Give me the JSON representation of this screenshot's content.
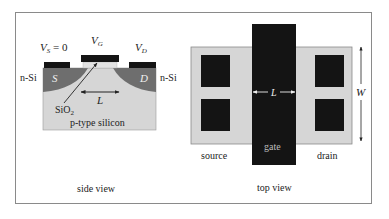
{
  "figure": {
    "side_view": {
      "caption": "side view",
      "labels": {
        "vs": "V",
        "vs_sub": "S",
        "vs_suffix": " = 0",
        "vg": "V",
        "vg_sub": "G",
        "vd": "V",
        "vd_sub": "D",
        "n_si_left": "n-Si",
        "n_si_right": "n-Si",
        "source_region": "S",
        "drain_region": "D",
        "length": "L",
        "oxide": "SiO",
        "oxide_sub": "2",
        "substrate": "p-type silicon"
      }
    },
    "top_view": {
      "caption": "top view",
      "labels": {
        "source": "source",
        "drain": "drain",
        "gate": "gate",
        "length": "L",
        "width": "W"
      }
    },
    "colors": {
      "substrate": "#d6d6d6",
      "well": "#6e6e6e",
      "metal": "#141414",
      "oxide": "#e2e2e2",
      "border": "#8a8a8a",
      "text": "#222222",
      "gate_text": "#bdbdbd"
    }
  }
}
